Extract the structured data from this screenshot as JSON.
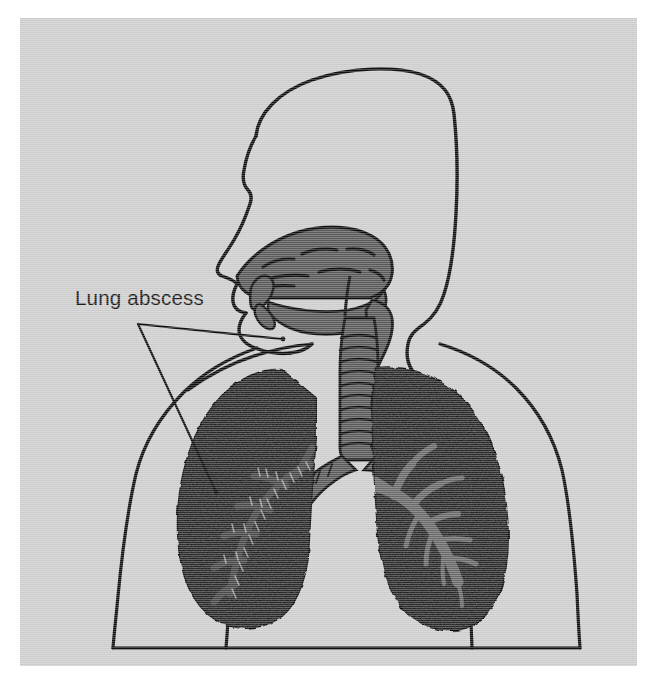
{
  "figure": {
    "kind": "medical-illustration",
    "subject": "Lung abscess",
    "view": "anterior torso with sagittal head section",
    "background_color": "#cfcfcf",
    "page_color": "#ffffff"
  },
  "annotations": {
    "label": "Lung abscess",
    "leader_note": "two-branch leader line pointing from label to right-lung abscess regions"
  },
  "palette": {
    "outline": "#111111",
    "airway_gray": "#5a5a5a",
    "lung_dark": "#151515",
    "bronchi_gray": "#6b6b6b",
    "panel": "#cfcfcf"
  },
  "structures": [
    {
      "name": "head-profile",
      "tone": "outline",
      "description": "sagittal head and face outline"
    },
    {
      "name": "nasal-cavity",
      "tone": "airway_gray",
      "description": "nasal cavity with turbinates"
    },
    {
      "name": "oral-cavity-palate",
      "tone": "airway_gray",
      "description": "soft palate, tongue and pharynx"
    },
    {
      "name": "pharynx-larynx",
      "tone": "airway_gray",
      "description": "pharynx continuing to larynx"
    },
    {
      "name": "trachea",
      "tone": "airway_gray",
      "description": "trachea with cartilage rings"
    },
    {
      "name": "carina",
      "tone": "airway_gray",
      "description": "tracheal bifurcation"
    },
    {
      "name": "left-lung",
      "tone": "lung_dark",
      "description": "viewer-left lung, consolidated dark field"
    },
    {
      "name": "right-lung",
      "tone": "lung_dark",
      "description": "viewer-right lung with scalloped pleural margin"
    },
    {
      "name": "left-bronchial-tree",
      "tone": "lung_dark",
      "description": "bronchial branches within viewer-left lung"
    },
    {
      "name": "right-bronchial-tree",
      "tone": "bronchi_gray",
      "description": "gray bronchial tree within viewer-right lung"
    },
    {
      "name": "torso-outline",
      "tone": "outline",
      "description": "shoulders, arms and chest contour"
    }
  ]
}
